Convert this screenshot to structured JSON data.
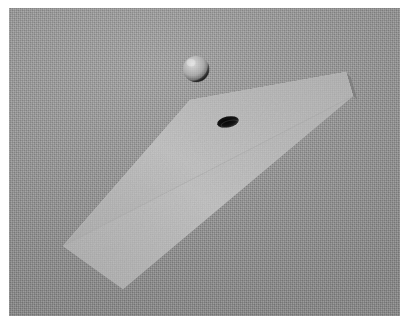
{
  "image": {
    "title": "3D rendered scene: sphere above a slab with a hole",
    "width": 409,
    "height": 325,
    "border": {
      "color": "#ffffff",
      "width_px": 8
    }
  },
  "scene": {
    "background": {
      "name": "gray-noisy-backdrop",
      "color": "#989898",
      "texture": "fine-grain-noise"
    },
    "objects": [
      {
        "id": "slab",
        "label": "rectangular slab",
        "shape": "box",
        "faces": {
          "top": {
            "color": "#b9b9b9",
            "label": "top face"
          },
          "front": {
            "color": "#8b8b8b",
            "label": "front long face"
          },
          "end": {
            "color": "#9d9d9d",
            "label": "right end cap"
          }
        },
        "top_face_points": "63,246 190,100 346,72 353,96 123,289",
        "front_face_points": "63,246 123,289 353,96 346,72",
        "end_face_points": "346,72 353,96 358,101 351,77"
      },
      {
        "id": "hole",
        "label": "dark elliptical hole on slab",
        "shape": "ellipse",
        "color": "#1a1a1a",
        "center_x": 228,
        "center_y": 122,
        "radius_x": 11,
        "radius_y": 5.5,
        "rotation_deg": -12
      },
      {
        "id": "sphere",
        "label": "gray sphere hovering above slab",
        "shape": "sphere",
        "color": "#b4b4b4",
        "highlight_color": "#d2d2d2",
        "shadow_color": "#3a3a3a",
        "center_x": 196,
        "center_y": 69,
        "radius": 13
      }
    ]
  }
}
